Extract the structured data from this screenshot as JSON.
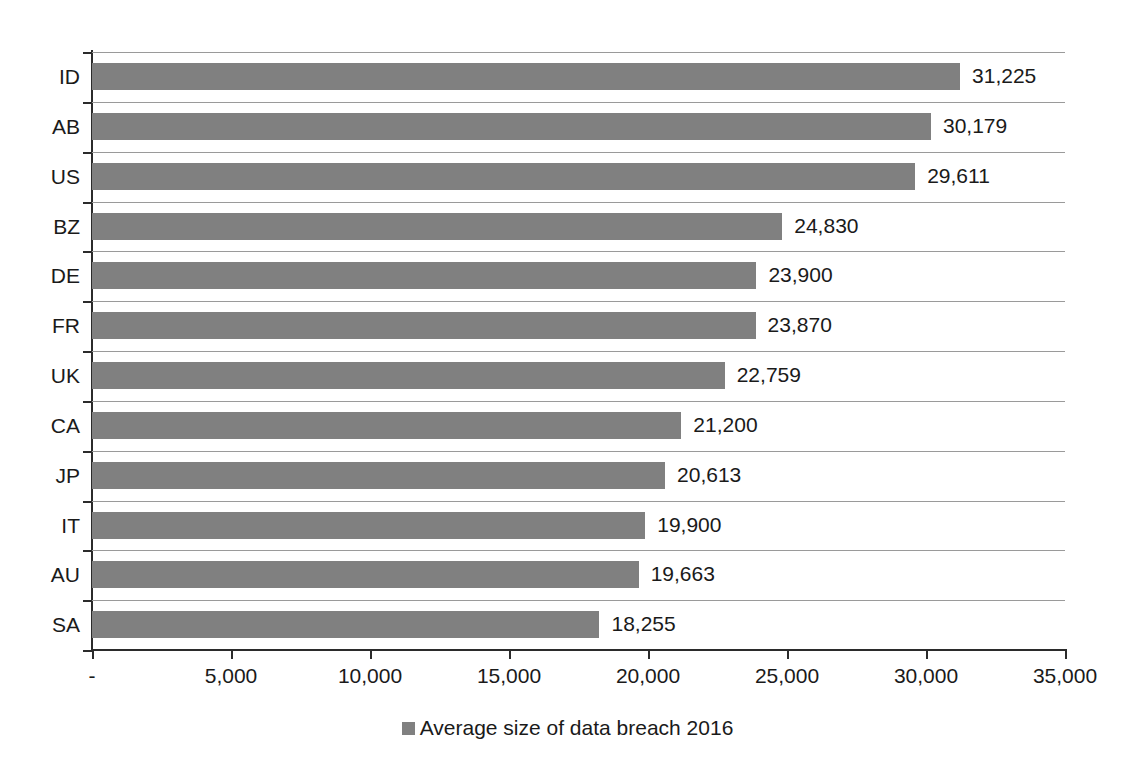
{
  "chart_data": {
    "type": "bar",
    "orientation": "horizontal",
    "title": "",
    "xlabel": "",
    "ylabel": "",
    "categories": [
      "ID",
      "AB",
      "US",
      "BZ",
      "DE",
      "FR",
      "UK",
      "CA",
      "JP",
      "IT",
      "AU",
      "SA"
    ],
    "values": [
      31225,
      30179,
      29611,
      24830,
      23900,
      23870,
      22759,
      21200,
      20613,
      19900,
      19663,
      18255
    ],
    "value_labels": [
      "31,225",
      "30,179",
      "29,611",
      "24,830",
      "23,900",
      "23,870",
      "22,759",
      "21,200",
      "20,613",
      "19,900",
      "19,663",
      "18,255"
    ],
    "series": [
      {
        "name": "Average size of data breach 2016",
        "color": "#808080",
        "values": [
          31225,
          30179,
          29611,
          24830,
          23900,
          23870,
          22759,
          21200,
          20613,
          19900,
          19663,
          18255
        ]
      }
    ],
    "xlim": [
      0,
      35000
    ],
    "xticks": [
      0,
      5000,
      10000,
      15000,
      20000,
      25000,
      30000,
      35000
    ],
    "xtick_labels": [
      "-",
      "5,000",
      "10,000",
      "15,000",
      "20,000",
      "25,000",
      "30,000",
      "35,000"
    ],
    "grid": "horizontal",
    "legend_position": "bottom",
    "legend": [
      "Average size of data breach 2016"
    ]
  },
  "legend": {
    "label": "Average size of data breach 2016",
    "swatch_color": "#808080"
  },
  "axis": {
    "line_color": "#2b2b2b",
    "grid_color": "#9a9a9a"
  }
}
